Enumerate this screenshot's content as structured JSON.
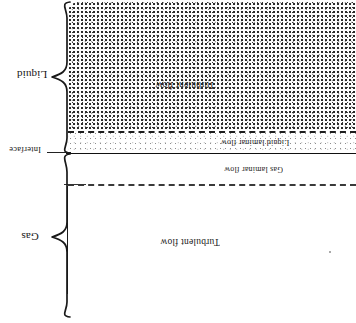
{
  "diagram": {
    "orientation_note": "rotated-180",
    "regions": [
      {
        "id": "liquid",
        "brace_label": "Liquid",
        "sublayers": [
          {
            "id": "liquid-turbulent",
            "label": "Turbulent flow",
            "fill": "dense-stipple"
          },
          {
            "id": "liquid-laminar",
            "label": "Liquid laminar flow",
            "fill": "light-stipple"
          }
        ]
      },
      {
        "id": "interface",
        "brace_label": "Interface",
        "line_style": "solid"
      },
      {
        "id": "gas",
        "brace_label": "Gas",
        "sublayers": [
          {
            "id": "gas-laminar",
            "label": "Gas laminar flow",
            "fill": "none"
          },
          {
            "id": "gas-turbulent",
            "label": "Turbulent flow",
            "fill": "none"
          }
        ]
      }
    ],
    "labels": {
      "liquid": "Liquid",
      "interface": "Interface",
      "gas": "Gas",
      "liquid_turbulent_flow": "Turbulent flow",
      "liquid_laminar_flow": "Liquid laminar flow",
      "gas_laminar_flow": "Gas laminar flow",
      "gas_turbulent_flow": "Turbulent flow"
    },
    "colors": {
      "ink": "#1a1a1a",
      "dense_stipple": "#2b2b2b",
      "light_stipple": "#8d8d8d",
      "background": "#ffffff",
      "dashed_line": "#1d1d1d"
    }
  }
}
